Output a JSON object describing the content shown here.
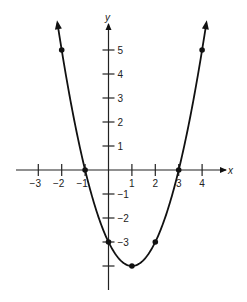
{
  "chart_data": {
    "type": "line",
    "title": "",
    "xlabel": "x",
    "ylabel": "y",
    "function": "y = x^2 - 2x - 3",
    "x": [
      -2,
      -1,
      0,
      1,
      2,
      3,
      4
    ],
    "y": [
      5,
      0,
      -3,
      -4,
      -3,
      0,
      5
    ],
    "points": [
      {
        "x": -2,
        "y": 5
      },
      {
        "x": -1,
        "y": 0
      },
      {
        "x": 0,
        "y": -3
      },
      {
        "x": 1,
        "y": -4
      },
      {
        "x": 2,
        "y": -3
      },
      {
        "x": 3,
        "y": 0
      },
      {
        "x": 4,
        "y": 5
      }
    ],
    "x_ticks": [
      -3,
      -2,
      -1,
      1,
      2,
      3,
      4
    ],
    "x_tick_labels": [
      "−3",
      "−2",
      "−1",
      "1",
      "2",
      "3",
      "4"
    ],
    "y_ticks": [
      5,
      4,
      3,
      2,
      1,
      -1,
      -2,
      -3,
      -4
    ],
    "y_tick_labels": [
      "5",
      "4",
      "3",
      "2",
      "1",
      "−1",
      "−2",
      "−3",
      ""
    ],
    "xlim": [
      -4,
      5
    ],
    "ylim": [
      -5,
      6
    ],
    "grid": false,
    "legend": null,
    "curve_arrows": true
  }
}
